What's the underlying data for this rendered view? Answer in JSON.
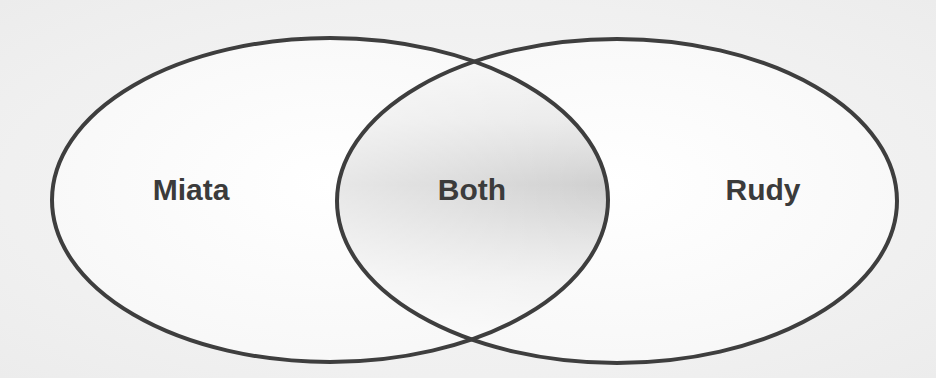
{
  "diagram": {
    "type": "venn",
    "colors": {
      "background": "#f2f2f2",
      "fill": "#fbfbfb",
      "stroke": "#3e3e3e",
      "intersection_shade": "#c9c9c9",
      "label": "#3b3b3b"
    },
    "sets": [
      {
        "id": "left",
        "label": "Miata",
        "cx": 330,
        "cy": 200,
        "rx": 278,
        "ry": 162
      },
      {
        "id": "right",
        "label": "Rudy",
        "cx": 617,
        "cy": 201,
        "rx": 280,
        "ry": 162
      }
    ],
    "intersection": {
      "label": "Both"
    },
    "labels": {
      "left": "Miata",
      "center": "Both",
      "right": "Rudy"
    }
  }
}
